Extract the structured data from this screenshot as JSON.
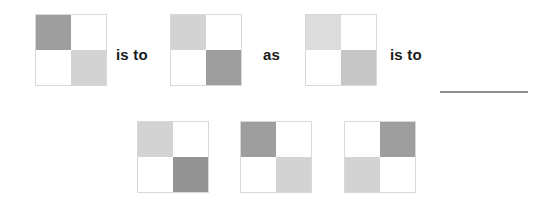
{
  "puzzle": {
    "type": "visual-analogy-matrix",
    "palette": {
      "white": "#ffffff",
      "light_gray": "#d3d3d3",
      "medium_light_gray": "#c6c6c6",
      "medium_gray": "#9e9e9e",
      "dark_medium_gray": "#949494",
      "very_light_gray": "#dcdcdc",
      "tile_border": "#d8d8d8",
      "blank_line": "#8e8e8e",
      "text": "#1a1a1a",
      "background": "#ffffff"
    },
    "prompt_row": {
      "tiles": [
        {
          "label": "A",
          "cells": {
            "top_left": "#9e9e9e",
            "top_right": "#ffffff",
            "bottom_left": "#ffffff",
            "bottom_right": "#d3d3d3"
          }
        },
        {
          "label": "B",
          "cells": {
            "top_left": "#d3d3d3",
            "top_right": "#ffffff",
            "bottom_left": "#ffffff",
            "bottom_right": "#9e9e9e"
          }
        },
        {
          "label": "C",
          "cells": {
            "top_left": "#dcdcdc",
            "top_right": "#ffffff",
            "bottom_left": "#ffffff",
            "bottom_right": "#c6c6c6"
          }
        }
      ],
      "connectors": [
        {
          "text": "is to"
        },
        {
          "text": "as"
        },
        {
          "text": "is to"
        }
      ],
      "answer_blank": {
        "present": true,
        "color": "#8e8e8e"
      }
    },
    "option_row": {
      "tiles": [
        {
          "label": "option-1",
          "cells": {
            "top_left": "#d3d3d3",
            "top_right": "#ffffff",
            "bottom_left": "#ffffff",
            "bottom_right": "#949494"
          }
        },
        {
          "label": "option-2",
          "cells": {
            "top_left": "#9e9e9e",
            "top_right": "#ffffff",
            "bottom_left": "#ffffff",
            "bottom_right": "#d3d3d3"
          }
        },
        {
          "label": "option-3",
          "cells": {
            "top_left": "#ffffff",
            "top_right": "#9e9e9e",
            "bottom_left": "#d3d3d3",
            "bottom_right": "#ffffff"
          }
        }
      ]
    }
  }
}
